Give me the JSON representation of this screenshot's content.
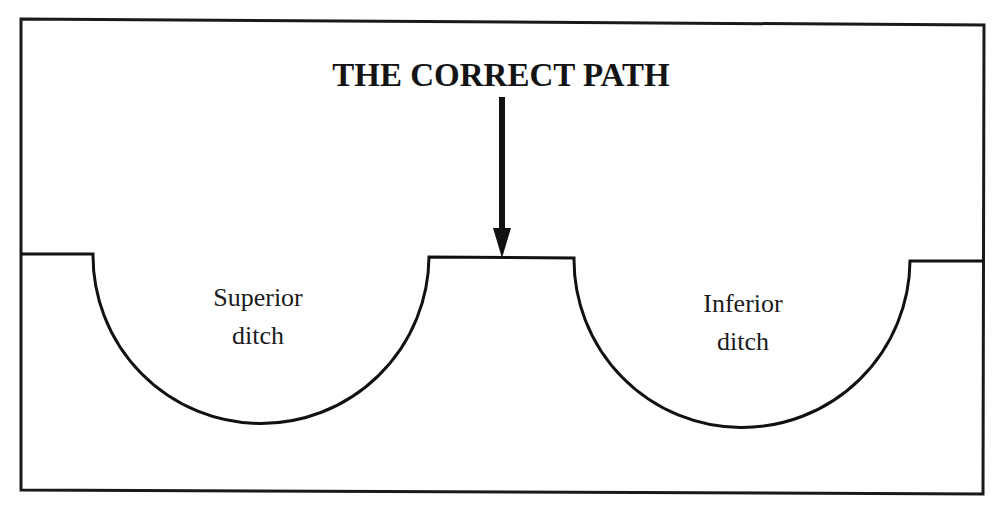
{
  "diagram": {
    "title": "THE CORRECT PATH",
    "arrow": {
      "description": "downward arrow pointing to the path between ditches",
      "icon": "arrow-down-icon"
    },
    "ditches": [
      {
        "label_line1": "Superior",
        "label_line2": "ditch"
      },
      {
        "label_line1": "Inferior",
        "label_line2": "ditch"
      }
    ],
    "colors": {
      "stroke": "#111111",
      "background": "#ffffff"
    }
  }
}
